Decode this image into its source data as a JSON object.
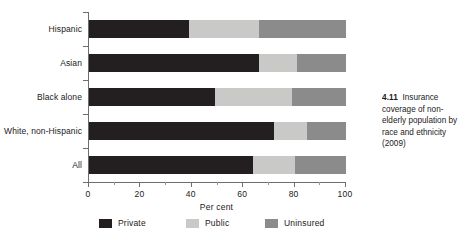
{
  "caption": {
    "number": "4.11",
    "text": "Insurance coverage of non-elderly population by race and ethnicity (2009)"
  },
  "axis": {
    "xlabel": "Per cent",
    "xticks": [
      "0",
      "20",
      "40",
      "60",
      "80",
      "100"
    ]
  },
  "legend": {
    "items": [
      {
        "label": "Private",
        "color": "#231f20"
      },
      {
        "label": "Public",
        "color": "#c9c9c7"
      },
      {
        "label": "Uninsured",
        "color": "#8b8b8b"
      }
    ]
  },
  "chart_data": {
    "type": "bar",
    "orientation": "horizontal",
    "stacked": true,
    "title": "Insurance coverage of non-elderly population by race and ethnicity (2009)",
    "xlabel": "Per cent",
    "ylabel": "",
    "xlim": [
      0,
      100
    ],
    "xticks": [
      0,
      20,
      40,
      60,
      80,
      100
    ],
    "grid": false,
    "legend_position": "bottom",
    "categories": [
      "Hispanic",
      "Asian",
      "Black alone",
      "White, non-Hispanic",
      "All"
    ],
    "series": [
      {
        "name": "Private",
        "color": "#231f20",
        "values": [
          39,
          66,
          49,
          72,
          64
        ]
      },
      {
        "name": "Public",
        "color": "#c9c9c7",
        "values": [
          27,
          15,
          30,
          13,
          16
        ]
      },
      {
        "name": "Uninsured",
        "color": "#8b8b8b",
        "values": [
          34,
          19,
          21,
          15,
          20
        ]
      }
    ]
  }
}
